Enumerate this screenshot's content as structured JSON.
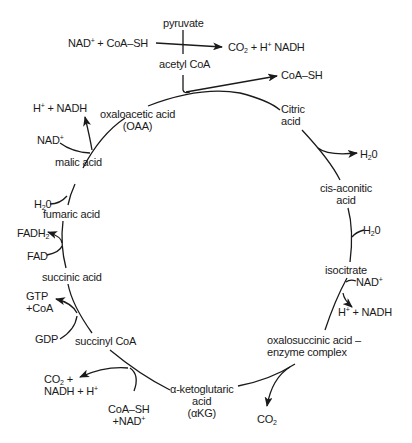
{
  "entry": {
    "pyruvate": "pyruvate",
    "acetyl_coa": "acetyl CoA",
    "inputs": "NAD+ + CoA–SH",
    "outputs": "CO2 + H+ NADH",
    "coa_release": "CoA–SH"
  },
  "cycle_intermediates": [
    {
      "id": "citric",
      "lines": [
        "Citric",
        "acid"
      ]
    },
    {
      "id": "cis-aconitic",
      "lines": [
        "cis-aconitic",
        "acid"
      ]
    },
    {
      "id": "isocitrate",
      "lines": [
        "isocitrate"
      ]
    },
    {
      "id": "oxalosuccinic",
      "lines": [
        "oxalosuccinic acid –",
        "enzyme complex"
      ]
    },
    {
      "id": "alpha-kg",
      "lines": [
        "α-ketoglutaric",
        "acid",
        "(αKG)"
      ]
    },
    {
      "id": "succinyl-coa",
      "lines": [
        "succinyl CoA"
      ]
    },
    {
      "id": "succinic",
      "lines": [
        "succinic acid"
      ]
    },
    {
      "id": "fumaric",
      "lines": [
        "fumaric acid"
      ]
    },
    {
      "id": "malic",
      "lines": [
        "malic acid"
      ]
    },
    {
      "id": "oaa",
      "lines": [
        "oxaloacetic acid",
        "(OAA)"
      ]
    }
  ],
  "side_reactions": {
    "citric_h2o_out": "H2O",
    "cis_h2o_in": "H2O",
    "iso_nad_in": "NAD+",
    "iso_nadh_out": "H+ + NADH",
    "oxalo_co2_out": "CO2",
    "akg_in": [
      "CoA–SH",
      "+NAD+"
    ],
    "akg_out": [
      "CO2 +",
      "NADH + H+"
    ],
    "succ_gdp_in": "GDP",
    "succ_gtp_out": [
      "GTP",
      "+CoA"
    ],
    "succinic_fad_in": "FAD",
    "succinic_fadh2_out": "FADH2",
    "fumaric_h2o_in": "H2O",
    "malic_nad_in": "NAD+",
    "malic_nadh_out": "H+ + NADH"
  }
}
